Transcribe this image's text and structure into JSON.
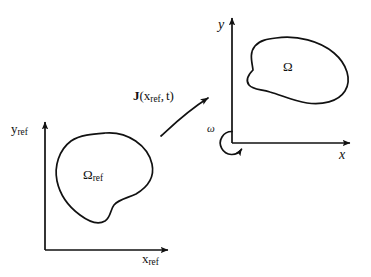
{
  "figure": {
    "background_color": "#ffffff",
    "stroke_color": "#111111",
    "width": 371,
    "height": 277
  },
  "reference_frame": {
    "name": "reference configuration axes",
    "y_axis_label": "y",
    "y_axis_subscript": "ref",
    "x_axis_label": "x",
    "x_axis_subscript": "ref",
    "domain_label": "Ω",
    "domain_subscript": "ref"
  },
  "current_frame": {
    "name": "current configuration axes",
    "y_axis_label": "y",
    "x_axis_label": "x",
    "domain_label": "Ω",
    "angular_velocity_label": "ω"
  },
  "mapping": {
    "operator": "J",
    "open_paren": "(",
    "argument": "x",
    "argument_subscript": "ref",
    "comma": ",",
    "time": "t",
    "close_paren": ")",
    "arrow_name": "mapping-arrow"
  },
  "icons": {
    "axis_arrow": "arrow-head-icon",
    "rotation_arrow": "circular-arrow-icon"
  }
}
